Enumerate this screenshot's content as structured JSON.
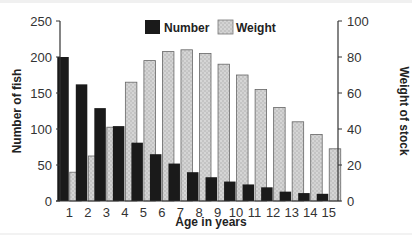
{
  "chart_data": {
    "type": "bar",
    "title": "",
    "xlabel": "Age in years",
    "ylabel": "Number of fish",
    "y2label": "Weight of stock",
    "categories": [
      "1",
      "2",
      "3",
      "4",
      "5",
      "6",
      "7",
      "8",
      "9",
      "10",
      "11",
      "12",
      "13",
      "14",
      "15"
    ],
    "series": [
      {
        "name": "Number",
        "axis": "left",
        "color": "#1a1a1a",
        "values": [
          200,
          162,
          129,
          104,
          81,
          65,
          52,
          40,
          33,
          27,
          23,
          19,
          13,
          11,
          10
        ]
      },
      {
        "name": "Weight",
        "axis": "right",
        "color": "#c8c8c8",
        "pattern": "dotted",
        "values": [
          16,
          25,
          41,
          66,
          78,
          83,
          84,
          82,
          76,
          70,
          62,
          52,
          44,
          37,
          29
        ]
      }
    ],
    "ylim": [
      0,
      250
    ],
    "y2lim": [
      0,
      100
    ],
    "yticks": [
      0,
      50,
      100,
      150,
      200,
      250
    ],
    "y2ticks": [
      0,
      20,
      40,
      60,
      80,
      100
    ],
    "grid": false,
    "legend_position": "top-center"
  },
  "legend": {
    "number_label": "Number",
    "weight_label": "Weight"
  },
  "axes": {
    "x_title": "Age in years",
    "y_title": "Number of fish",
    "y2_title": "Weight of stock"
  }
}
